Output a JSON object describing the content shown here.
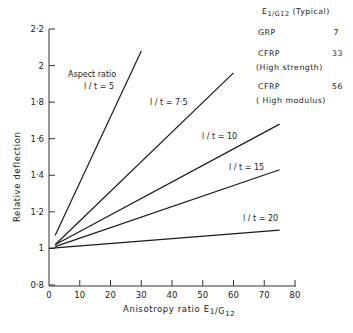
{
  "chart_data": {
    "type": "line",
    "title": "",
    "xlabel": "Anisotropy ratio E1/G12",
    "xlabel_main": "Anisotropy ratio E",
    "xlabel_sub1": "1",
    "xlabel_sub2": "/G",
    "xlabel_sub3": "12",
    "ylabel": "Relative deflection",
    "xlim": [
      0,
      80
    ],
    "ylim": [
      0.8,
      2.2
    ],
    "x_ticks": [
      0,
      10,
      20,
      30,
      40,
      50,
      60,
      70,
      80
    ],
    "x_tick_labels": [
      "0",
      "10",
      "20",
      "30",
      "40",
      "50",
      "60",
      "70",
      "80"
    ],
    "y_ticks": [
      0.8,
      1.0,
      1.2,
      1.4,
      1.6,
      1.8,
      2.0,
      2.2
    ],
    "y_tick_labels": [
      "0·8",
      "1",
      "1·2",
      "1·4",
      "1·6",
      "1·8",
      "2",
      "2·2"
    ],
    "grid": false,
    "annotation_title": "Aspect ratio",
    "series": [
      {
        "name": "l / t = 5",
        "label": "l / t = 5",
        "x": [
          2,
          30
        ],
        "y": [
          1.07,
          2.08
        ]
      },
      {
        "name": "l / t = 7·5",
        "label": "l / t = 7·5",
        "x": [
          2,
          60
        ],
        "y": [
          1.02,
          1.96
        ]
      },
      {
        "name": "l / t = 10",
        "label": "l / t = 10",
        "x": [
          2,
          75
        ],
        "y": [
          1.02,
          1.68
        ]
      },
      {
        "name": "l / t = 15",
        "label": "l / t = 15",
        "x": [
          2,
          75
        ],
        "y": [
          1.01,
          1.43
        ]
      },
      {
        "name": "l / t = 20",
        "label": "l / t = 20",
        "x": [
          0,
          75
        ],
        "y": [
          1.0,
          1.1
        ]
      }
    ],
    "legend": {
      "title": "E1/G12 (Typical)",
      "title_main": "E",
      "title_sub": "1/G12",
      "title_suffix": "(Typical)",
      "position": "top-right",
      "entries": [
        {
          "material": "GRP",
          "note": "",
          "value": "7"
        },
        {
          "material": "CFRP",
          "note": "(High strength)",
          "value": "33"
        },
        {
          "material": "CFRP",
          "note": "( High modulus)",
          "value": "56"
        }
      ]
    }
  }
}
